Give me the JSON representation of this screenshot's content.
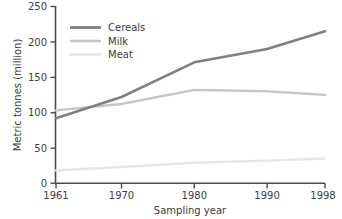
{
  "chart_data": {
    "type": "line",
    "title": "",
    "xlabel": "Sampling year",
    "ylabel": "Metric tonnes (million)",
    "x": [
      1961,
      1970,
      1980,
      1990,
      1998
    ],
    "xticklabels": [
      "1961",
      "1970",
      "1980",
      "1990",
      "1998"
    ],
    "yticks": [
      0,
      50,
      100,
      150,
      200,
      250
    ],
    "yticklabels": [
      "0",
      "50",
      "100",
      "150",
      "200",
      "250"
    ],
    "xlim": [
      1961,
      1998
    ],
    "ylim": [
      0,
      250
    ],
    "grid": false,
    "legend_position": "top-left",
    "series": [
      {
        "name": "Cereals",
        "color": "#808080",
        "width": 2.6,
        "values": [
          92,
          122,
          171,
          190,
          215
        ]
      },
      {
        "name": "Milk",
        "color": "#c6c6c6",
        "width": 2.4,
        "values": [
          103,
          112,
          132,
          130,
          125
        ]
      },
      {
        "name": "Meat",
        "color": "#e6e6e6",
        "width": 2.4,
        "values": [
          18,
          23,
          29,
          32,
          35
        ]
      }
    ]
  },
  "axes": {
    "x_title": "Sampling year",
    "y_title": "Metric tonnes (million)",
    "x_tick_0": "1961",
    "x_tick_1": "1970",
    "x_tick_2": "1980",
    "x_tick_3": "1990",
    "x_tick_4": "1998",
    "y_tick_0": "0",
    "y_tick_1": "50",
    "y_tick_2": "100",
    "y_tick_3": "150",
    "y_tick_4": "200",
    "y_tick_5": "250"
  },
  "legend": {
    "item_0": "Cereals",
    "item_1": "Milk",
    "item_2": "Meat"
  },
  "colors": {
    "cereals": "#808080",
    "milk": "#c6c6c6",
    "meat": "#e6e6e6",
    "axis": "#4a4a4a",
    "text": "#3a3a3a",
    "background": "#ffffff"
  }
}
